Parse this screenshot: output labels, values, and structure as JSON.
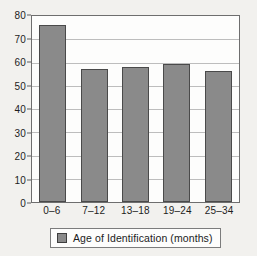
{
  "chart_data": {
    "type": "bar",
    "title": "",
    "subtitle": "",
    "xlabel": "",
    "ylabel": "",
    "categories": [
      "0–6",
      "7–12",
      "13–18",
      "19–24",
      "25–34"
    ],
    "values": [
      76,
      57,
      58,
      59.5,
      56.5
    ],
    "series": [
      {
        "name": "Age of Identification (months)",
        "values": [
          76,
          57,
          58,
          59.5,
          56.5
        ]
      }
    ],
    "ylim": [
      0,
      80
    ],
    "xlim": null,
    "y_ticks": [
      0,
      10,
      20,
      30,
      40,
      50,
      60,
      70,
      80
    ],
    "y_tick_labels": [
      "0",
      "10",
      "20",
      "30",
      "40",
      "50",
      "60",
      "70",
      "80"
    ],
    "x_tick_labels": [
      "0–6",
      "7–12",
      "13–18",
      "19–24",
      "25–34"
    ],
    "grid": true,
    "grid_axis": "y",
    "legend": {
      "position": "bottom",
      "entries": [
        {
          "label": "Age of Identification (months)",
          "color": "#8a8a8a"
        }
      ]
    },
    "annotations": [],
    "colors": {
      "bar_fill": "#8a8a8a",
      "bar_border": "#4a4a4a",
      "plot_background": "#fdfdfc",
      "page_background": "#f2f1ee",
      "gridline": "#bdbdbd",
      "axis_line": "#6e6e6e",
      "text": "#1d1d1d"
    }
  }
}
